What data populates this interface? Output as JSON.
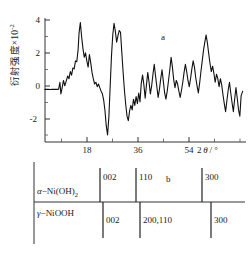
{
  "figure": {
    "panel_a_letter": "a",
    "panel_b_letter": "b"
  },
  "axes": {
    "ylabel_text": "衍射强度×10",
    "ylabel_exponent": "-2",
    "yticks": [
      "4",
      "2",
      "0",
      "-2"
    ],
    "ytick_values": [
      4,
      2,
      0,
      -2
    ],
    "xticks": [
      "18",
      "36",
      "54"
    ],
    "xtick_values": [
      18,
      36,
      54
    ],
    "xaxis_title_prefix": "2",
    "xaxis_title_theta": "θ",
    "xaxis_title_suffix": "/ °"
  },
  "phases": {
    "alpha": {
      "prefix": "α",
      "dash": "−",
      "name": "Ni(OH)",
      "subscript": "2",
      "reflections": [
        {
          "hkl": "002",
          "two_theta": 11.4
        },
        {
          "hkl": "110",
          "two_theta": 34.4
        },
        {
          "hkl": "300",
          "two_theta": 59.8
        }
      ]
    },
    "gamma": {
      "prefix": "γ",
      "dash": "−",
      "name": "NiOOH",
      "subscript": "",
      "reflections": [
        {
          "hkl": "002",
          "two_theta": 12.8
        },
        {
          "hkl": "200,110",
          "two_theta": 36.5
        },
        {
          "hkl": "300",
          "two_theta": 64.4
        }
      ]
    }
  },
  "chart_data": {
    "type": "line",
    "title": "",
    "subtitle": "",
    "xlabel": "2θ / °",
    "ylabel": "衍射强度×10⁻²",
    "xlim": [
      8,
      70
    ],
    "ylim": [
      -3,
      4.4
    ],
    "grid": false,
    "legend": "none",
    "annotations": [
      {
        "text": "a",
        "x": 47,
        "y": 3.2
      }
    ],
    "series": [
      {
        "name": "XRD pattern",
        "x": [
          8.0,
          9.0,
          9.6,
          10.2,
          10.8,
          11.3,
          11.8,
          12.2,
          12.6,
          12.9,
          13.3,
          13.7,
          14.1,
          14.6,
          15.0,
          15.4,
          15.8,
          16.2,
          16.6,
          17.0,
          17.4,
          17.8,
          18.2,
          18.5,
          18.9,
          19.3,
          19.7,
          20.1,
          20.5,
          20.9,
          21.3,
          21.7,
          22.1,
          22.5,
          22.9,
          23.3,
          23.7,
          24.1,
          24.5,
          24.9,
          25.3,
          25.7,
          26.1,
          26.5,
          26.9,
          27.3,
          27.7,
          28.1,
          28.5,
          28.9,
          29.3,
          29.7,
          30.1,
          30.5,
          30.9,
          31.3,
          31.7,
          32.1,
          32.5,
          32.9,
          33.3,
          33.7,
          34.1,
          34.5,
          34.9,
          35.3,
          35.7,
          36.1,
          36.5,
          36.9,
          37.3,
          37.7,
          38.1,
          38.5,
          38.9,
          39.3,
          39.7,
          40.1,
          40.5,
          40.9,
          41.3,
          41.7,
          42.1,
          42.5,
          42.9,
          43.3,
          43.7,
          44.1,
          44.5,
          44.9,
          45.3,
          45.7,
          46.1,
          46.5,
          46.9,
          47.3,
          47.7,
          48.1,
          48.5,
          48.9,
          49.3,
          49.7,
          50.1,
          50.5,
          50.9,
          51.3,
          51.7,
          52.1,
          52.5,
          52.9,
          53.3,
          53.7,
          54.1,
          54.5,
          54.9,
          55.3,
          55.7,
          56.1,
          56.5,
          56.9,
          57.3,
          57.7,
          58.1,
          58.5,
          58.9,
          59.3,
          59.7,
          60.1,
          60.5,
          60.9,
          61.3,
          61.7,
          62.1,
          62.5,
          62.9,
          63.3,
          63.7,
          64.1,
          64.5,
          64.9,
          65.3,
          65.7,
          66.1,
          66.5,
          66.9,
          67.3,
          67.7,
          68.1,
          68.5,
          69.0
        ],
        "y": [
          -0.05,
          -0.05,
          -0.06,
          -0.05,
          -0.04,
          -0.05,
          -0.05,
          -0.04,
          0.35,
          -0.3,
          0.05,
          0.45,
          0.15,
          0.45,
          0.7,
          0.55,
          0.95,
          0.75,
          1.15,
          1.1,
          1.55,
          1.5,
          2.15,
          3.1,
          3.7,
          2.9,
          2.25,
          1.75,
          2.0,
          1.55,
          1.2,
          1.9,
          1.45,
          0.9,
          0.55,
          0.25,
          0.35,
          0.1,
          0.25,
          0.05,
          -0.15,
          -0.3,
          -0.65,
          -1.25,
          -2.1,
          -2.6,
          -1.6,
          0.1,
          1.8,
          3.0,
          3.65,
          3.2,
          2.6,
          2.95,
          3.25,
          3.15,
          2.0,
          0.9,
          -0.1,
          -0.9,
          -1.55,
          -1.8,
          -1.25,
          -0.95,
          -1.2,
          -0.6,
          -0.95,
          -0.45,
          -0.85,
          -0.25,
          -0.75,
          0.3,
          0.75,
          0.2,
          -0.55,
          0.2,
          0.9,
          0.35,
          -0.3,
          0.15,
          0.8,
          1.35,
          0.7,
          0.1,
          -0.5,
          -0.05,
          0.55,
          1.05,
          0.4,
          -0.25,
          -0.6,
          -0.15,
          0.45,
          1.05,
          1.75,
          1.2,
          0.5,
          0.05,
          0.45,
          0.25,
          -0.15,
          -0.5,
          -0.1,
          0.35,
          0.9,
          1.35,
          0.95,
          0.45,
          0.1,
          0.55,
          1.1,
          1.55,
          1.2,
          0.6,
          0.15,
          -0.25,
          0.3,
          0.95,
          1.55,
          2.15,
          2.6,
          3.0,
          2.55,
          1.95,
          1.4,
          0.95,
          1.25,
          0.85,
          0.35,
          0.8,
          0.55,
          0.1,
          0.55,
          0.2,
          -0.35,
          -0.85,
          -1.3,
          -0.7,
          -0.1,
          0.35,
          -0.25,
          -0.8,
          -1.3,
          -0.6,
          0.05,
          -0.55,
          -1.2,
          -1.55,
          -0.4,
          -0.15
        ]
      }
    ]
  }
}
